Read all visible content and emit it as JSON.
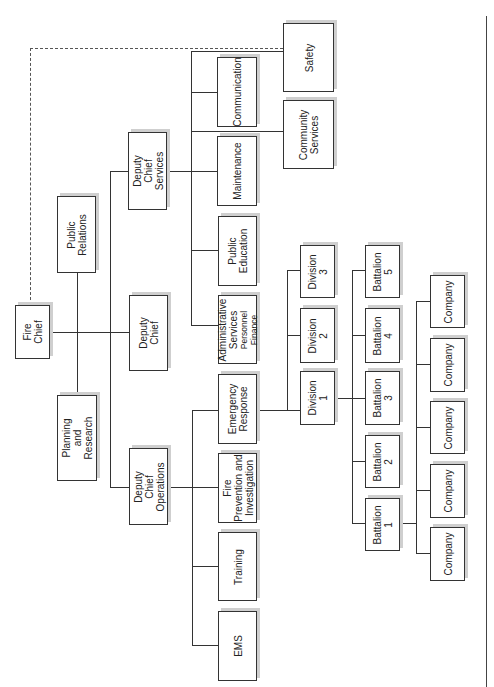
{
  "diagram": {
    "title": "",
    "orientation": "rotated-90-ccw",
    "nodes": {
      "fire_chief": "Fire\nChief",
      "public_relations": "Public\nRelations",
      "planning_research": "Planning\nand\nResearch",
      "deputy_chief_services": "Deputy\nChief\nServices",
      "deputy_chief": "Deputy\nChief",
      "deputy_chief_operations": "Deputy\nChief\nOperations",
      "communication": "Communication",
      "maintenance": "Maintenance",
      "public_education": "Public\nEducation",
      "administrative_services": "Administrative\nServices",
      "administrative_services_sub": "Personnel\nFinance",
      "safety": "Safety",
      "community_services": "Community\nServices",
      "emergency_response": "Emergency\nResponse",
      "fire_prevention": "Fire\nPrevention and\nInvestigation",
      "training": "Training",
      "ems": "EMS",
      "division_1": "Division\n1",
      "division_2": "Division\n2",
      "division_3": "Division\n3",
      "battalion_1": "Battalion\n1",
      "battalion_2": "Battalion\n2",
      "battalion_3": "Battalion\n3",
      "battalion_4": "Battalion\n4",
      "battalion_5": "Battalion\n5",
      "company": "Company"
    },
    "edges": [
      [
        "Fire Chief",
        "Public Relations"
      ],
      [
        "Fire Chief",
        "Planning and Research"
      ],
      [
        "Fire Chief",
        "Deputy Chief"
      ],
      [
        "Fire Chief",
        "Deputy Chief Services"
      ],
      [
        "Fire Chief",
        "Deputy Chief Operations"
      ],
      [
        "Fire Chief",
        "Safety",
        "dashed"
      ],
      [
        "Deputy Chief Services",
        "Communication"
      ],
      [
        "Deputy Chief Services",
        "Maintenance"
      ],
      [
        "Deputy Chief Services",
        "Public Education"
      ],
      [
        "Deputy Chief Services",
        "Administrative Services"
      ],
      [
        "Deputy Chief Services",
        "Safety"
      ],
      [
        "Deputy Chief Services",
        "Community Services"
      ],
      [
        "Deputy Chief Operations",
        "Emergency Response"
      ],
      [
        "Deputy Chief Operations",
        "Fire Prevention and Investigation"
      ],
      [
        "Deputy Chief Operations",
        "Training"
      ],
      [
        "Deputy Chief Operations",
        "EMS"
      ],
      [
        "Emergency Response",
        "Division 1"
      ],
      [
        "Emergency Response",
        "Division 2"
      ],
      [
        "Emergency Response",
        "Division 3"
      ],
      [
        "Division 1",
        "Battalion 1"
      ],
      [
        "Division 1",
        "Battalion 2"
      ],
      [
        "Division 1",
        "Battalion 3"
      ],
      [
        "Division 1",
        "Battalion 4"
      ],
      [
        "Division 1",
        "Battalion 5"
      ],
      [
        "Battalion 1",
        "Company x5"
      ]
    ]
  }
}
